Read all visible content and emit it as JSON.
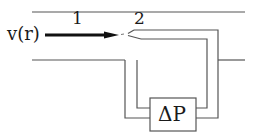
{
  "diagram": {
    "labels": {
      "velocity": "v(r)",
      "point1": "1",
      "point2": "2",
      "pressure_gauge": "ΔP"
    },
    "colors": {
      "line": "#555555",
      "arrow": "#111111",
      "text": "#1a1a1a"
    }
  }
}
